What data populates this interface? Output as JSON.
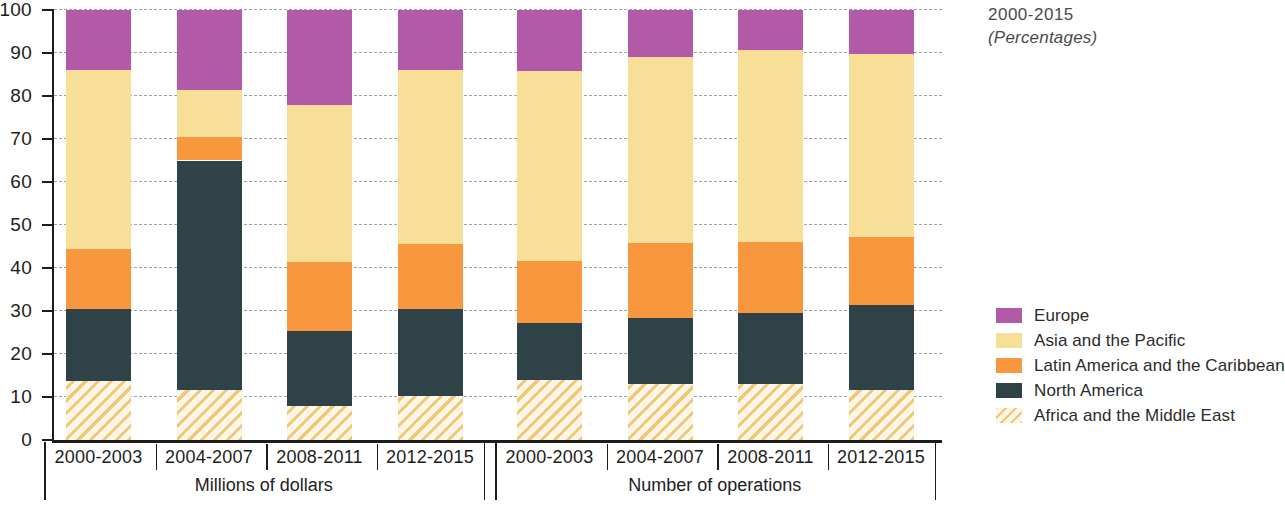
{
  "title": {
    "line1": "2000-2015",
    "line2": "(Percentages)"
  },
  "axes": {
    "y_ticks": [
      "100",
      "90",
      "80",
      "70",
      "60",
      "50",
      "40",
      "30",
      "20",
      "10",
      "0"
    ],
    "y_min": 0,
    "y_max": 100
  },
  "groups": [
    {
      "label": "Millions of dollars",
      "categories": [
        "2000-2003",
        "2004-2007",
        "2008-2011",
        "2012-2015"
      ]
    },
    {
      "label": "Number of operations",
      "categories": [
        "2000-2003",
        "2004-2007",
        "2008-2011",
        "2012-2015"
      ]
    }
  ],
  "legend": [
    {
      "label": "Europe",
      "color": "#b25aa8",
      "pattern": "solid"
    },
    {
      "label": "Asia and the Pacific",
      "color": "#f7df97",
      "pattern": "solid"
    },
    {
      "label": "Latin America and the Caribbean",
      "color": "#f8973e",
      "pattern": "solid"
    },
    {
      "label": "North America",
      "color": "#2e4248",
      "pattern": "solid"
    },
    {
      "label": "Africa and the Middle East",
      "color": "#f0c878",
      "pattern": "diagonal-hatch"
    }
  ],
  "chart_data": {
    "type": "bar",
    "title": "2000-2015",
    "subtitle": "(Percentages)",
    "stacked": true,
    "stack_total": 100,
    "xlabel": "",
    "ylabel": "",
    "ylim": [
      0,
      100
    ],
    "ytick_step": 10,
    "grid": true,
    "grid_style": "dashed-horizontal",
    "legend_position": "right",
    "group_labels": [
      "Millions of dollars",
      "Number of operations"
    ],
    "categories": [
      "2000-2003",
      "2004-2007",
      "2008-2011",
      "2012-2015",
      "2000-2003",
      "2004-2007",
      "2008-2011",
      "2012-2015"
    ],
    "series": [
      {
        "name": "Africa and the Middle East",
        "color": "#f0c878",
        "values": [
          13.7,
          11.7,
          8.0,
          10.3,
          14.0,
          13.0,
          13.0,
          11.7
        ]
      },
      {
        "name": "North America",
        "color": "#2e4248",
        "values": [
          16.8,
          53.3,
          17.3,
          20.2,
          13.3,
          15.3,
          16.5,
          19.6
        ]
      },
      {
        "name": "Latin America and the Caribbean",
        "color": "#f8973e",
        "values": [
          14.0,
          5.5,
          16.0,
          15.0,
          14.4,
          17.4,
          16.5,
          16.0
        ]
      },
      {
        "name": "Asia and the Pacific",
        "color": "#f7df97",
        "values": [
          41.5,
          11.0,
          36.7,
          40.5,
          44.0,
          43.3,
          44.7,
          42.4
        ]
      },
      {
        "name": "Europe",
        "color": "#b25aa8",
        "values": [
          14.0,
          18.5,
          22.0,
          14.0,
          14.3,
          11.0,
          9.3,
          10.3
        ]
      }
    ],
    "cumulative_tops": [
      [
        13.7,
        30.5,
        44.5,
        86.0,
        100.0
      ],
      [
        11.7,
        65.0,
        70.5,
        81.5,
        100.0
      ],
      [
        8.0,
        25.3,
        41.3,
        78.0,
        100.0
      ],
      [
        10.3,
        30.5,
        45.5,
        86.0,
        100.0
      ],
      [
        14.0,
        27.3,
        41.7,
        85.7,
        100.0
      ],
      [
        13.0,
        28.3,
        45.7,
        89.0,
        100.0
      ],
      [
        13.0,
        29.5,
        46.0,
        90.7,
        100.0
      ],
      [
        11.7,
        31.3,
        47.3,
        89.7,
        100.0
      ]
    ]
  }
}
